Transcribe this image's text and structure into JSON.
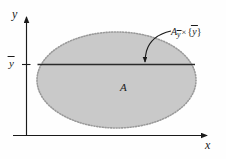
{
  "figure": {
    "kind": "math-diagram",
    "background_color": "#fefefe"
  },
  "axes": {
    "x": {
      "label": "x",
      "arrow": true,
      "color": "#1a1a1a"
    },
    "y": {
      "label": "y",
      "arrow": true,
      "color": "#1a1a1a"
    },
    "ticks": [
      {
        "axis": "y",
        "label_base": "y",
        "label_overbar": true,
        "name": "y-bar"
      }
    ]
  },
  "region": {
    "name": "A",
    "label": "A",
    "shape": "ellipse",
    "fill_color": "#c9c9c9",
    "border_style": "dotted",
    "border_color": "#9a9a9a"
  },
  "slice": {
    "name": "A-ybar-cross-ybar",
    "label_parts": {
      "set_base": "A",
      "set_subscript": "y",
      "set_subscript_overbar": true,
      "operator": "×",
      "open_brace": "{",
      "element_base": "y",
      "element_overbar": true,
      "close_brace": "}"
    },
    "line_color": "#1a1a1a",
    "pointer": "curved-arrow"
  }
}
